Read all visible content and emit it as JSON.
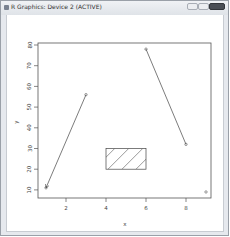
{
  "window": {
    "title": "R Graphics: Device 2 (ACTIVE)",
    "controls": [
      "minimize",
      "maximize",
      "close"
    ]
  },
  "plot": {
    "xlabel": "x",
    "ylabel": "y",
    "x_ticks": [
      "2",
      "4",
      "6",
      "8"
    ],
    "y_ticks": [
      "10",
      "20",
      "30",
      "40",
      "50",
      "60",
      "70",
      "80"
    ]
  },
  "chart_data": {
    "type": "scatter",
    "title": "",
    "xlabel": "x",
    "ylabel": "y",
    "xlim": [
      0.7,
      9.3
    ],
    "ylim": [
      8,
      82
    ],
    "x_ticks": [
      2,
      4,
      6,
      8
    ],
    "y_ticks": [
      10,
      20,
      30,
      40,
      50,
      60,
      70,
      80
    ],
    "grid": false,
    "points": [
      {
        "x": 1,
        "y": 11
      },
      {
        "x": 3,
        "y": 56
      },
      {
        "x": 6,
        "y": 78
      },
      {
        "x": 8,
        "y": 32
      },
      {
        "x": 9,
        "y": 9
      }
    ],
    "annotations": [
      {
        "type": "arrow",
        "from": [
          3,
          56
        ],
        "to": [
          1,
          11
        ]
      },
      {
        "type": "segment",
        "from": [
          6,
          78
        ],
        "to": [
          8,
          32
        ]
      },
      {
        "type": "rect",
        "xleft": 4,
        "ybottom": 20,
        "xright": 6,
        "ytop": 30,
        "fill": "hatched"
      }
    ]
  }
}
